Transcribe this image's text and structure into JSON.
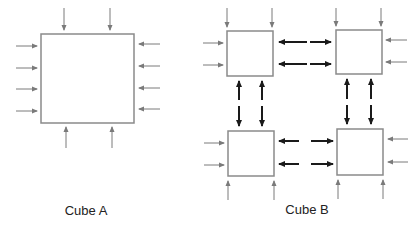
{
  "labels": {
    "cube_a": "Cube A",
    "cube_b": "Cube B"
  },
  "colors": {
    "box_stroke": "#8a8a8a",
    "external_arrow": "#7a7a7a",
    "internal_arrow": "#1a1a1a",
    "text": "#222222"
  },
  "cube_a": {
    "box": {
      "x": 41,
      "y": 34,
      "w": 93,
      "h": 89
    },
    "incoming_arrows": {
      "top": 2,
      "bottom": 2,
      "left": 4,
      "right": 4
    }
  },
  "cube_b": {
    "sub_boxes": [
      {
        "id": "top-left",
        "x": 227,
        "y": 31,
        "w": 46,
        "h": 45
      },
      {
        "id": "top-right",
        "x": 336,
        "y": 30,
        "w": 46,
        "h": 44
      },
      {
        "id": "bottom-left",
        "x": 228,
        "y": 131,
        "w": 46,
        "h": 45
      },
      {
        "id": "bottom-right",
        "x": 337,
        "y": 129,
        "w": 46,
        "h": 46
      }
    ],
    "external_arrows_per_exposed_side": 2,
    "internal_exchange_pairs_per_interface": 2
  }
}
